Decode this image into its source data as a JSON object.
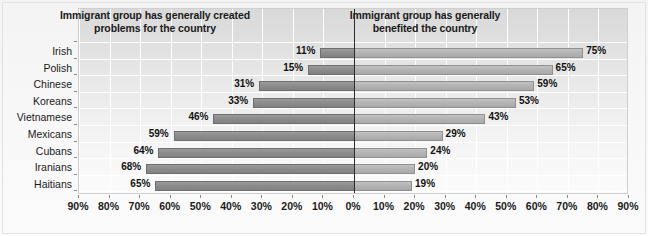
{
  "chart": {
    "type": "diverging-bar",
    "panel_titles": {
      "left": "Immigrant group has generally created problems for the country",
      "left_line1": "Immigrant group has generally created",
      "left_line2": "problems for the country",
      "right": "Immigrant group has generally benefited the country",
      "right_line1": "Immigrant group has generally",
      "right_line2": "benefited the country"
    },
    "colors": {
      "bar_left": "#8c8c8c",
      "bar_right": "#b4b4b4",
      "zero_axis": "#2b2b2b",
      "gridline": "#ffffff",
      "plot_background": "#e6e6e6",
      "page_background": "#f7f7f7",
      "text": "#1a1a1a"
    }
  },
  "chart_data": {
    "type": "bar",
    "title": "",
    "subtitle": "",
    "xlabel": "",
    "ylabel": "",
    "orientation": "horizontal",
    "layout": "diverging",
    "grid": true,
    "legend": false,
    "xlim": [
      -90,
      90
    ],
    "axis_direction": "left-negative-right-positive",
    "categories": [
      "Irish",
      "Polish",
      "Chinese",
      "Koreans",
      "Vietnamese",
      "Mexicans",
      "Cubans",
      "Iranians",
      "Haitians"
    ],
    "xticks": [
      -90,
      -80,
      -70,
      -60,
      -50,
      -40,
      -30,
      -20,
      -10,
      0,
      10,
      20,
      30,
      40,
      50,
      60,
      70,
      80,
      90
    ],
    "xticklabels": [
      "90%",
      "80%",
      "70%",
      "60%",
      "50%",
      "40%",
      "30%",
      "20%",
      "10%",
      "0%",
      "10%",
      "20%",
      "30%",
      "40%",
      "50%",
      "60%",
      "70%",
      "80%",
      "90%"
    ],
    "series": [
      {
        "name": "Immigrant group has generally created problems for the country",
        "side": "left",
        "values": [
          11,
          15,
          31,
          33,
          46,
          59,
          64,
          68,
          65
        ],
        "labels": [
          "11%",
          "15%",
          "31%",
          "33%",
          "46%",
          "59%",
          "64%",
          "68%",
          "65%"
        ]
      },
      {
        "name": "Immigrant group has generally benefited the country",
        "side": "right",
        "values": [
          75,
          65,
          59,
          53,
          43,
          29,
          24,
          20,
          19
        ],
        "labels": [
          "75%",
          "65%",
          "59%",
          "53%",
          "43%",
          "29%",
          "24%",
          "20%",
          "19%"
        ]
      }
    ]
  }
}
